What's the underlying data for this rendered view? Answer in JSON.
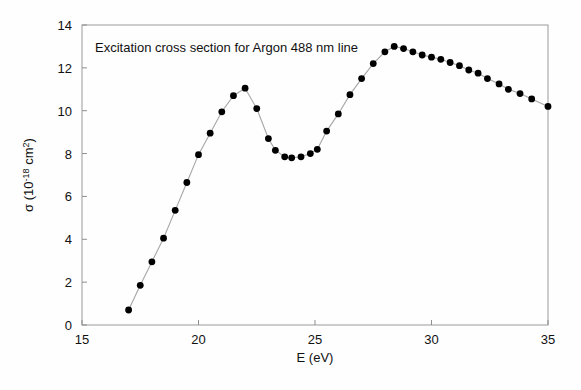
{
  "chart_data": {
    "type": "scatter",
    "title": "Excitation cross section for Argon 488 nm line",
    "xlabel": "E (eV)",
    "ylabel_parts": {
      "sigma": "σ (10",
      "exponent": "-18",
      "tail": " cm",
      "squared": "2",
      "close": ")"
    },
    "ylabel": "σ (10-18 cm2)",
    "xlim": [
      15,
      35
    ],
    "ylim": [
      0,
      14
    ],
    "xticks": [
      15,
      20,
      25,
      30,
      35
    ],
    "xtick_labels": [
      "15",
      "20",
      "25",
      "30",
      "35"
    ],
    "yticks": [
      0,
      2,
      4,
      6,
      8,
      10,
      12,
      14
    ],
    "ytick_labels": [
      "0",
      "2",
      "4",
      "6",
      "8",
      "10",
      "12",
      "14"
    ],
    "grid": false,
    "legend": null,
    "marker": "filled-circle",
    "marker_color": "#000000",
    "line_color": "#a6a6a6",
    "x": [
      17.0,
      17.5,
      18.0,
      18.5,
      19.0,
      19.5,
      20.0,
      20.5,
      21.0,
      21.5,
      22.0,
      22.5,
      23.0,
      23.3,
      23.7,
      24.0,
      24.4,
      24.8,
      25.1,
      25.5,
      26.0,
      26.5,
      27.0,
      27.5,
      28.0,
      28.4,
      28.8,
      29.2,
      29.6,
      30.0,
      30.4,
      30.8,
      31.2,
      31.6,
      32.0,
      32.4,
      32.9,
      33.3,
      33.8,
      34.3,
      35.0
    ],
    "y": [
      0.7,
      1.85,
      2.95,
      4.05,
      5.35,
      6.65,
      7.95,
      8.95,
      9.95,
      10.7,
      11.05,
      10.1,
      8.7,
      8.15,
      7.85,
      7.8,
      7.85,
      8.0,
      8.2,
      9.05,
      9.85,
      10.75,
      11.5,
      12.2,
      12.75,
      13.0,
      12.9,
      12.75,
      12.6,
      12.5,
      12.4,
      12.25,
      12.1,
      11.9,
      11.75,
      11.5,
      11.25,
      11.0,
      10.8,
      10.55,
      10.2
    ]
  }
}
